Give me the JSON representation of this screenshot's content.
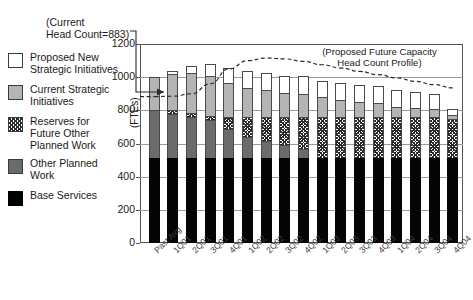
{
  "annotations": {
    "head_count_note_line1": "(Current",
    "head_count_note_line2": "Head Count=883)",
    "capacity_note_line1": "(Proposed Future Capacity",
    "capacity_note_line2": "Head Count Profile)"
  },
  "legend": {
    "items": [
      {
        "label_line1": "Proposed New",
        "label_line2": "Strategic Initiatives",
        "label_line3": "",
        "swatch": "white",
        "key": "proposed-new-strategic-initiatives"
      },
      {
        "label_line1": "Current Strategic",
        "label_line2": "Initiatives",
        "label_line3": "",
        "swatch": "lgray",
        "key": "current-strategic-initiatives"
      },
      {
        "label_line1": "Reserves for",
        "label_line2": "Future Other",
        "label_line3": "Planned Work",
        "swatch": "hatch",
        "key": "reserves-future-other-planned-work"
      },
      {
        "label_line1": "Other Planned",
        "label_line2": "Work",
        "label_line3": "",
        "swatch": "dgray",
        "key": "other-planned-work"
      },
      {
        "label_line1": "Base Services",
        "label_line2": "",
        "label_line3": "",
        "swatch": "black",
        "key": "base-services"
      }
    ]
  },
  "chart_data": {
    "type": "bar",
    "stacked": true,
    "title": "",
    "xlabel": "",
    "ylabel": "(FTEs)",
    "ylim": [
      0,
      1200
    ],
    "yticks": [
      0,
      200,
      400,
      600,
      800,
      1000,
      1200
    ],
    "grid": true,
    "legend_position": "left-outside",
    "categories": [
      "Past Avg",
      "1Q01",
      "2Q01",
      "3Q01",
      "4Q01",
      "1Q02",
      "2Q02",
      "3Q02",
      "4Q02",
      "1Q03",
      "2Q03",
      "3Q03",
      "4Q03",
      "1Q04",
      "2Q04",
      "3Q04",
      "4Q04"
    ],
    "series": [
      {
        "name": "Base Services",
        "swatch": "black",
        "values": [
          510,
          510,
          510,
          510,
          510,
          510,
          510,
          510,
          510,
          510,
          510,
          510,
          510,
          510,
          510,
          510,
          510
        ]
      },
      {
        "name": "Other Planned Work",
        "swatch": "dgray",
        "values": [
          290,
          270,
          250,
          230,
          175,
          130,
          105,
          80,
          55,
          0,
          0,
          0,
          0,
          0,
          0,
          0,
          0
        ]
      },
      {
        "name": "Reserves for Future Other Planned Work",
        "swatch": "hatch",
        "values": [
          0,
          25,
          25,
          25,
          75,
          120,
          145,
          170,
          195,
          250,
          250,
          250,
          250,
          250,
          250,
          250,
          240
        ]
      },
      {
        "name": "Current Strategic Initiatives",
        "swatch": "lgray",
        "values": [
          200,
          215,
          240,
          245,
          205,
          175,
          160,
          145,
          140,
          120,
          105,
          90,
          85,
          60,
          55,
          50,
          20
        ]
      },
      {
        "name": "Proposed New Strategic Initiatives",
        "swatch": "white",
        "values": [
          0,
          20,
          45,
          70,
          90,
          100,
          105,
          105,
          105,
          100,
          100,
          100,
          100,
          100,
          95,
          90,
          40
        ]
      }
    ],
    "totals": [
      1000,
      1040,
      1070,
      1080,
      1055,
      1035,
      1025,
      1010,
      1005,
      980,
      965,
      950,
      945,
      920,
      910,
      900,
      810
    ],
    "capacity_line": {
      "name": "Proposed Future Capacity Head Count Profile",
      "style": "dashed",
      "values": [
        883,
        885,
        900,
        960,
        1050,
        1100,
        1115,
        1110,
        1095,
        1075,
        1055,
        1035,
        1015,
        995,
        975,
        955,
        935
      ]
    },
    "current_head_count": 883
  }
}
